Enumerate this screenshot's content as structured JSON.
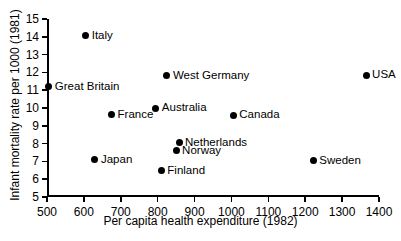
{
  "chart_data": {
    "type": "scatter",
    "title": "",
    "xlabel": "Per capita health expenditure (1982)",
    "ylabel": "Infant mortality rate per 1000 (1981)",
    "xlim": [
      500,
      1400
    ],
    "ylim": [
      5,
      15
    ],
    "xticks": [
      500,
      600,
      700,
      800,
      900,
      1000,
      1100,
      1200,
      1300,
      1400
    ],
    "yticks": [
      5,
      6,
      7,
      8,
      9,
      10,
      11,
      12,
      13,
      14,
      15
    ],
    "xtick_labels": [
      "500",
      "600",
      "700",
      "800",
      "900",
      "1000",
      "1100",
      "1200",
      "1300",
      "1400"
    ],
    "ytick_labels": [
      "5",
      "6",
      "7",
      "8",
      "9",
      "10",
      "11",
      "12",
      "13",
      "14",
      "15"
    ],
    "grid": false,
    "legend": false,
    "marker": "filled-circle",
    "marker_color": "#000000",
    "points": [
      {
        "label": "Italy",
        "x": 605,
        "y": 14.05,
        "label_side": "right"
      },
      {
        "label": "West Germany",
        "x": 825,
        "y": 11.8,
        "label_side": "right"
      },
      {
        "label": "USA",
        "x": 1365,
        "y": 11.85,
        "label_side": "right"
      },
      {
        "label": "Great Britain",
        "x": 505,
        "y": 11.2,
        "label_side": "right"
      },
      {
        "label": "Australia",
        "x": 795,
        "y": 10.0,
        "label_side": "right"
      },
      {
        "label": "France",
        "x": 675,
        "y": 9.65,
        "label_side": "right"
      },
      {
        "label": "Canada",
        "x": 1005,
        "y": 9.6,
        "label_side": "right"
      },
      {
        "label": "Netherlands",
        "x": 858,
        "y": 8.05,
        "label_side": "right"
      },
      {
        "label": "Norway",
        "x": 850,
        "y": 7.6,
        "label_side": "right"
      },
      {
        "label": "Japan",
        "x": 630,
        "y": 7.1,
        "label_side": "right"
      },
      {
        "label": "Sweden",
        "x": 1222,
        "y": 7.05,
        "label_side": "right"
      },
      {
        "label": "Finland",
        "x": 810,
        "y": 6.5,
        "label_side": "right"
      }
    ]
  }
}
